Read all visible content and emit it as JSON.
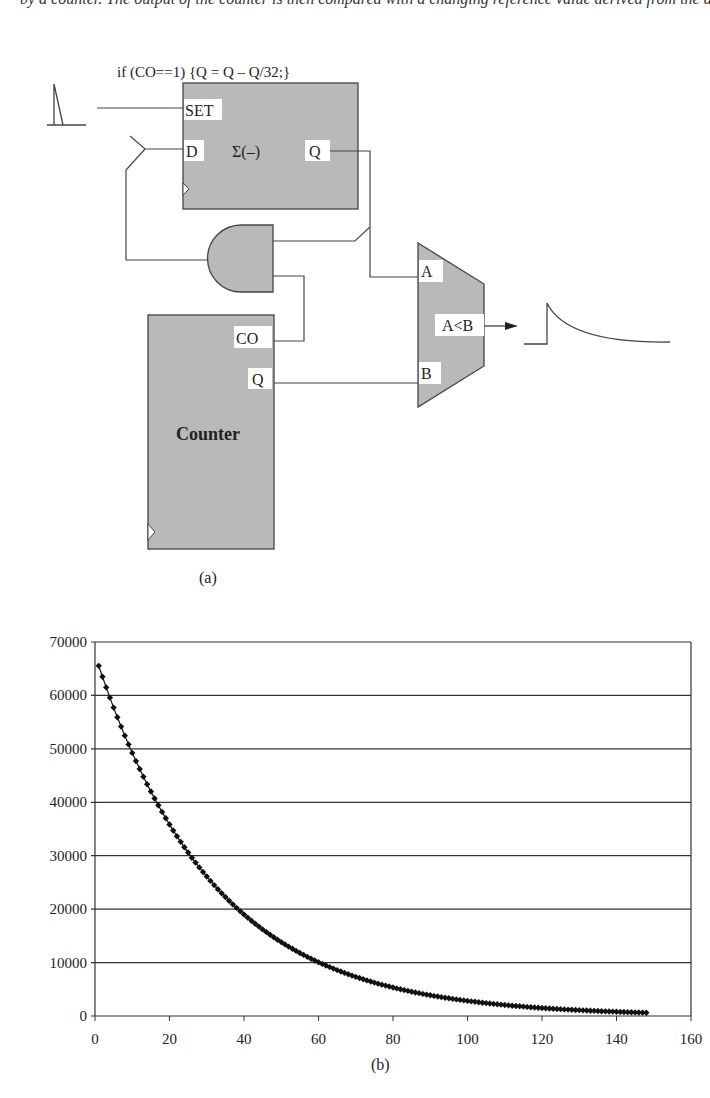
{
  "header_text": "by a counter. The output of the counter is then compared with a changing reference value derived from the average of the signals in the previous period.",
  "diagram": {
    "caption": "(a)",
    "annotation": "if (CO==1) {Q = Q – Q/32;}",
    "register_block": {
      "set_label": "SET",
      "d_label": "D",
      "op_label": "Σ(–)",
      "q_label": "Q"
    },
    "counter_block": {
      "title": "Counter",
      "co_label": "CO",
      "q_label": "Q"
    },
    "comparator": {
      "a_label": "A",
      "b_label": "B",
      "out_label": "A<B"
    },
    "colors": {
      "block_fill": "#b9b9b9",
      "line": "#444444",
      "label_bg": "#ffffff"
    }
  },
  "chart_caption": "(b)",
  "chart_data": {
    "type": "scatter",
    "title": "",
    "xlabel": "",
    "ylabel": "",
    "xlim": [
      0,
      160
    ],
    "ylim": [
      0,
      70000
    ],
    "x_ticks": [
      0,
      20,
      40,
      60,
      80,
      100,
      120,
      140,
      160
    ],
    "y_ticks": [
      0,
      10000,
      20000,
      30000,
      40000,
      50000,
      60000,
      70000
    ],
    "x_tick_labels": [
      "0",
      "20",
      "40",
      "60",
      "80",
      "100",
      "120",
      "140",
      "160"
    ],
    "y_tick_labels": [
      "0",
      "10000",
      "20000",
      "30000",
      "40000",
      "50000",
      "60000",
      "70000"
    ],
    "grid": {
      "horizontal": true,
      "vertical": false
    },
    "legend": null,
    "marker": "diamond",
    "series": [
      {
        "name": "Q",
        "formula": "Q(n) = 65536 * (31/32)^(n-1)",
        "x_range": [
          1,
          148
        ],
        "sample_points": [
          {
            "x": 1,
            "y": 65536
          },
          {
            "x": 10,
            "y": 49000
          },
          {
            "x": 20,
            "y": 36800
          },
          {
            "x": 30,
            "y": 26900
          },
          {
            "x": 40,
            "y": 19600
          },
          {
            "x": 50,
            "y": 14300
          },
          {
            "x": 60,
            "y": 10500
          },
          {
            "x": 70,
            "y": 7600
          },
          {
            "x": 80,
            "y": 5600
          },
          {
            "x": 90,
            "y": 4100
          },
          {
            "x": 100,
            "y": 3000
          },
          {
            "x": 110,
            "y": 2200
          },
          {
            "x": 120,
            "y": 1600
          },
          {
            "x": 130,
            "y": 1150
          },
          {
            "x": 140,
            "y": 850
          },
          {
            "x": 148,
            "y": 660
          }
        ]
      }
    ]
  }
}
